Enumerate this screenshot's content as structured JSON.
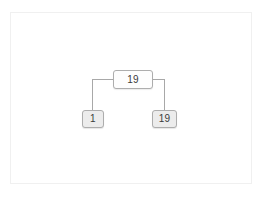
{
  "diagram": {
    "type": "binary-tree",
    "background_color": "#ffffff",
    "frame": {
      "border_color": "#f0f0f0"
    },
    "connector": {
      "color": "#a8a8a8",
      "style": "orthogonal-elbow",
      "width": 1
    },
    "nodes": [
      {
        "id": "root",
        "label": "19",
        "role": "root",
        "fill": "#fdfdfd",
        "border_color": "#adadad",
        "text_color": "#3b3b3b"
      },
      {
        "id": "left",
        "label": "1",
        "role": "leaf",
        "fill": "#ececec",
        "border_color": "#adadad",
        "text_color": "#3b3b3b"
      },
      {
        "id": "right",
        "label": "19",
        "role": "leaf",
        "fill": "#ececec",
        "border_color": "#adadad",
        "text_color": "#3b3b3b"
      }
    ],
    "edges": [
      {
        "from": "root",
        "to": "left"
      },
      {
        "from": "root",
        "to": "right"
      }
    ]
  }
}
